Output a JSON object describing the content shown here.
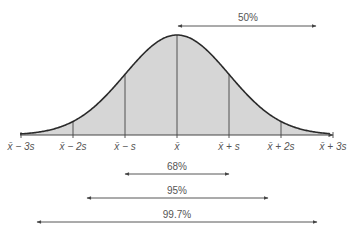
{
  "diagram": {
    "type": "normal-curve",
    "colors": {
      "fill": "#d6d6d6",
      "stroke": "#333333",
      "text": "#555555"
    },
    "axis_ticks": [
      {
        "label": "x̄ − 3s",
        "sd": -3
      },
      {
        "label": "x̄ − 2s",
        "sd": -2
      },
      {
        "label": "x̄ − s",
        "sd": -1
      },
      {
        "label": "x̄",
        "sd": 0
      },
      {
        "label": "x̄ + s",
        "sd": 1
      },
      {
        "label": "x̄ + 2s",
        "sd": 2
      },
      {
        "label": "x̄ + 3s",
        "sd": 3
      }
    ],
    "ranges": [
      {
        "label": "50%",
        "from_sd": 0,
        "to_sd": "+inf",
        "position": "top"
      },
      {
        "label": "68%",
        "from_sd": -1,
        "to_sd": 1
      },
      {
        "label": "95%",
        "from_sd": -2,
        "to_sd": 2
      },
      {
        "label": "99.7%",
        "from_sd": -3,
        "to_sd": 3
      }
    ]
  }
}
